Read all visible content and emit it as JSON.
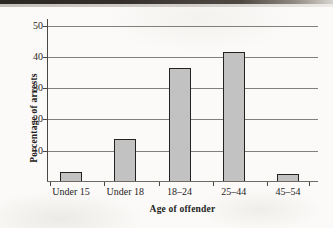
{
  "chart_data": {
    "type": "bar",
    "title": "",
    "subtitle": "",
    "xlabel": "Age of offender",
    "ylabel": "Percentage of arrests",
    "categories": [
      "Under 15",
      "Under 18",
      "18–24",
      "25–44",
      "45–54"
    ],
    "values": [
      3.2,
      13.8,
      36.4,
      41.5,
      2.6
    ],
    "series": [
      {
        "name": "Percentage of arrests",
        "values": [
          3.2,
          13.8,
          36.4,
          41.5,
          2.6
        ]
      }
    ],
    "ylim": [
      0,
      51.5
    ],
    "xlim_categories": 5,
    "yticks": [
      10,
      20,
      30,
      40,
      50
    ],
    "ytick_labels": [
      "10",
      "20",
      "30",
      "40",
      "50"
    ],
    "grid": "horizontal",
    "legend": "none",
    "bar_fill_color": "#c2c2c2",
    "bar_border_color": "#242220",
    "gridline_color": "#6d6a66",
    "background_color": "#fbfaf8",
    "annotations": []
  },
  "figure": {
    "caption": "",
    "scan_artifact_top_band": true
  }
}
